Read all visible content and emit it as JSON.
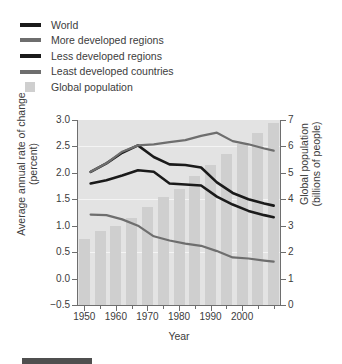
{
  "legend": {
    "items": [
      {
        "label": "World",
        "marker": "line",
        "color": "#1a1a1a"
      },
      {
        "label": "More developed regions",
        "marker": "line",
        "color": "#6e6e6e"
      },
      {
        "label": "Less developed regions",
        "marker": "line",
        "color": "#1a1a1a"
      },
      {
        "label": "Least developed countries",
        "marker": "line",
        "color": "#6e6e6e"
      },
      {
        "label": "Global population",
        "marker": "box",
        "color": "#cfcfcf"
      }
    ]
  },
  "chart_data": {
    "type": "line",
    "title": "",
    "xlabel": "Year",
    "ylabel": "Average annual rate of change (percent)",
    "ylabel_right": "Global population (billions of people)",
    "xlim": [
      1948,
      2012
    ],
    "ylim": [
      -0.5,
      3.0
    ],
    "ylim_right": [
      0,
      7
    ],
    "yticks": [
      "3.0",
      "2.5",
      "2.0",
      "1.5",
      "1.0",
      "0.5",
      "0.0",
      "-0.5"
    ],
    "ytick_values": [
      3.0,
      2.5,
      2.0,
      1.5,
      1.0,
      0.5,
      0.0,
      -0.5
    ],
    "yticks_right": [
      "7",
      "6",
      "5",
      "4",
      "3",
      "2",
      "1",
      "0"
    ],
    "ytick_values_right": [
      7,
      6,
      5,
      4,
      3,
      2,
      1,
      0
    ],
    "xticks": [
      "1950",
      "1960",
      "1970",
      "1980",
      "1990",
      "2000"
    ],
    "xtick_values": [
      1950,
      1960,
      1970,
      1980,
      1990,
      2000
    ],
    "xtick_minor_values": [
      1955,
      1965,
      1975,
      1985,
      1995,
      2005,
      2010
    ],
    "grid": "horizontal-major",
    "legend_position": "above-plot",
    "plot_background": "#e3e3e3",
    "series": [
      {
        "name": "World",
        "axis": "left",
        "color": "#1a1a1a",
        "width": 2.6,
        "x": [
          1952,
          1957,
          1962,
          1967,
          1972,
          1977,
          1982,
          1987,
          1992,
          1997,
          2002,
          2007,
          2010
        ],
        "values": [
          1.8,
          1.86,
          1.95,
          2.05,
          2.02,
          1.8,
          1.78,
          1.76,
          1.55,
          1.4,
          1.28,
          1.2,
          1.16
        ]
      },
      {
        "name": "More developed regions",
        "axis": "left",
        "color": "#6e6e6e",
        "width": 2.2,
        "x": [
          1952,
          1957,
          1962,
          1967,
          1972,
          1977,
          1982,
          1987,
          1992,
          1997,
          2002,
          2007,
          2010
        ],
        "values": [
          1.21,
          1.2,
          1.12,
          1.0,
          0.8,
          0.72,
          0.66,
          0.62,
          0.52,
          0.4,
          0.38,
          0.34,
          0.32
        ]
      },
      {
        "name": "Less developed regions",
        "axis": "left",
        "color": "#1a1a1a",
        "width": 2.6,
        "x": [
          1952,
          1957,
          1962,
          1967,
          1972,
          1977,
          1982,
          1987,
          1992,
          1997,
          2002,
          2007,
          2010
        ],
        "values": [
          2.02,
          2.18,
          2.38,
          2.52,
          2.3,
          2.16,
          2.15,
          2.1,
          1.82,
          1.62,
          1.5,
          1.42,
          1.38
        ]
      },
      {
        "name": "Least developed countries",
        "axis": "left",
        "color": "#6e6e6e",
        "width": 2.2,
        "x": [
          1952,
          1957,
          1962,
          1967,
          1972,
          1977,
          1982,
          1987,
          1992,
          1997,
          2002,
          2007,
          2010
        ],
        "values": [
          2.02,
          2.18,
          2.4,
          2.52,
          2.54,
          2.58,
          2.62,
          2.7,
          2.76,
          2.6,
          2.54,
          2.46,
          2.42
        ]
      }
    ],
    "bars": {
      "name": "Global population",
      "axis": "right",
      "color": "#cfcfcf",
      "unit": "billions of people",
      "x": [
        1950,
        1955,
        1960,
        1965,
        1970,
        1975,
        1980,
        1985,
        1990,
        1995,
        2000,
        2005,
        2010
      ],
      "values": [
        2.5,
        2.8,
        3.0,
        3.3,
        3.7,
        4.1,
        4.4,
        4.9,
        5.3,
        5.7,
        6.1,
        6.5,
        6.9
      ]
    }
  }
}
